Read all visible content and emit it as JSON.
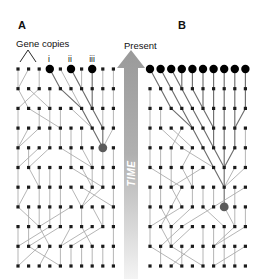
{
  "figure": {
    "background": "#ffffff",
    "width": 260,
    "height": 279
  },
  "panels": [
    {
      "id": "A",
      "letter": "A",
      "gene_copies_label": "Gene copies",
      "copy_labels": [
        "i",
        "ii",
        "iii"
      ],
      "sampled_columns": [
        3,
        5,
        7
      ],
      "mrca": {
        "col": 8,
        "row": 4
      }
    },
    {
      "id": "B",
      "letter": "B",
      "sampled_columns": [
        0,
        1,
        2,
        3,
        4,
        5,
        6,
        7,
        8,
        9
      ],
      "mrca": {
        "col": 7,
        "row": 7
      }
    }
  ],
  "time_axis": {
    "present_label": "Present",
    "time_label": "TIME",
    "direction": "up",
    "arrow_color": "#9a9a9a",
    "bar_top_color": "#9a9a9a",
    "bar_bottom_color": "#f2f2f2",
    "text_color": "#ffffff"
  },
  "colors": {
    "node_small": "#1b1b1b",
    "node_sampled": "#000000",
    "node_mrca": "#5b5b5b",
    "lineage_line": "#a8a8a8",
    "lineage_line_dark": "#6e6e6e",
    "text": "#111111"
  },
  "grid": {
    "columns": 10,
    "rows": 11,
    "panelA": {
      "x0": 18,
      "y0": 69,
      "dx": 10.6,
      "dy": 19.7
    },
    "panelB": {
      "x0": 150,
      "y0": 69,
      "dx": 10.6,
      "dy": 19.7
    },
    "small_node_size": 3.2,
    "sampled_node_radius": 4.2,
    "mrca_node_radius": 4.4
  },
  "chart_data": {
    "type": "diagram",
    "panelA": {
      "label": "A",
      "sample_size": 3,
      "sample_labels": [
        "i",
        "ii",
        "iii"
      ],
      "sample_columns": [
        3,
        5,
        7
      ],
      "mrca_generation_from_present": 4,
      "note": "Small sample of three gene copies; their most recent common ancestor is reached only a few generations back."
    },
    "panelB": {
      "label": "B",
      "sample_size": 10,
      "sample_columns": [
        0,
        1,
        2,
        3,
        4,
        5,
        6,
        7,
        8,
        9
      ],
      "mrca_generation_from_present": 7,
      "note": "All ten gene copies sampled; the most recent common ancestor of the whole population lies deeper in the past."
    },
    "axis": {
      "label": "TIME",
      "present_label": "Present",
      "direction": "upward (past at bottom, present at top)"
    }
  }
}
